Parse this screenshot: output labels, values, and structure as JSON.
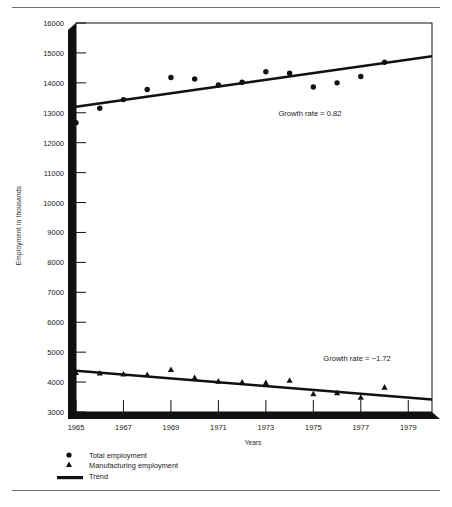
{
  "figure": {
    "ylabel": "Employment in thousands",
    "xlabel": "Years"
  },
  "annotations": {
    "total": "Growth rate = 0.82",
    "manufacturing": "Growth rate = −1.72"
  },
  "legend": [
    {
      "marker": "circle-marker",
      "label": "Total employment"
    },
    {
      "marker": "triangle-marker",
      "label": "Manufacturing employment"
    },
    {
      "marker": "line-marker",
      "label": "Trend"
    }
  ],
  "yticks": [
    "3000",
    "4000",
    "5000",
    "6000",
    "7000",
    "8000",
    "9000",
    "10000",
    "11000",
    "12000",
    "13000",
    "14000",
    "15000",
    "16000"
  ],
  "xticks": [
    "1965",
    "1967",
    "1969",
    "1971",
    "1973",
    "1975",
    "1977",
    "1979"
  ],
  "colors": {
    "ink": "#111111",
    "rule": "#6e6e6e",
    "frame": "#111111",
    "background": "#ffffff"
  },
  "chart_data": {
    "type": "scatter",
    "title": "",
    "xlabel": "Years",
    "ylabel": "Employment in thousands",
    "xlim": [
      1965,
      1980
    ],
    "ylim": [
      3000,
      16000
    ],
    "ytick_step": 1000,
    "xtick_step": 2,
    "grid": false,
    "legend_position": "below-axes-left",
    "series": [
      {
        "name": "Total employment",
        "marker": "circle",
        "x": [
          1965,
          1966,
          1967,
          1968,
          1969,
          1970,
          1971,
          1972,
          1973,
          1974,
          1975,
          1976,
          1977,
          1978
        ],
        "y": [
          12670,
          13150,
          13440,
          13780,
          14180,
          14130,
          13930,
          14020,
          14370,
          14320,
          13860,
          14000,
          14210,
          14690
        ]
      },
      {
        "name": "Manufacturing employment",
        "marker": "triangle",
        "x": [
          1965,
          1966,
          1967,
          1968,
          1969,
          1970,
          1971,
          1972,
          1973,
          1974,
          1975,
          1976,
          1977,
          1978
        ],
        "y": [
          4320,
          4300,
          4270,
          4250,
          4420,
          4150,
          4030,
          4000,
          3980,
          4060,
          3610,
          3640,
          3490,
          3830
        ]
      },
      {
        "name": "Trend",
        "marker": "line",
        "note": "total employment trend line",
        "x": [
          1965,
          1980
        ],
        "y": [
          13200,
          14890
        ]
      },
      {
        "name": "Trend",
        "marker": "line",
        "note": "manufacturing employment trend line",
        "x": [
          1965,
          1980
        ],
        "y": [
          4380,
          3420
        ]
      }
    ],
    "annotations": [
      {
        "text": "Growth rate = 0.82",
        "x": 1974.0,
        "y": 13150
      },
      {
        "text": "Growth rate = −1.72",
        "x": 1973.5,
        "y": 4520
      }
    ]
  }
}
